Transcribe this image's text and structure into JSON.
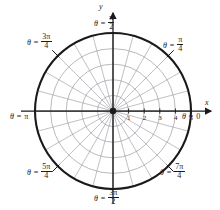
{
  "figure": {
    "kind": "polar-coordinate-grid",
    "background_color": "#ffffff",
    "ink_color": "#1a1a1a",
    "grid_color": "#8c8c96",
    "axis_color": "#4a4a4a",
    "center": {
      "x": 113,
      "y": 111
    },
    "outer_radius_px": 78
  },
  "axes": {
    "x_label": "x",
    "y_label": "y",
    "x_arrow": true,
    "y_arrow": true
  },
  "radial_ticks": {
    "values": [
      "1",
      "2",
      "3",
      "4",
      "5"
    ],
    "count": 5,
    "max": 5
  },
  "grid": {
    "circle_radii": [
      1,
      2,
      3,
      4,
      5
    ],
    "bold_circle_radius": 5,
    "spoke_count": 24,
    "spoke_step_label": "pi/12",
    "outer_tick_angles_deg": [
      45,
      135,
      225,
      315
    ]
  },
  "angle_labels": [
    {
      "id": "theta-0",
      "eq": "θ =",
      "value": "0",
      "kind": "plain",
      "angle_deg": 0,
      "x": 182,
      "y": 113
    },
    {
      "id": "theta-pi-4",
      "eq": "θ =",
      "num": "π",
      "den": "4",
      "kind": "frac",
      "angle_deg": 45,
      "x": 163,
      "y": 36
    },
    {
      "id": "theta-pi-2",
      "eq": "θ =",
      "num": "π",
      "den": "2",
      "kind": "frac",
      "angle_deg": 90,
      "x": 94,
      "y": 14
    },
    {
      "id": "theta-3pi-4",
      "eq": "θ =",
      "num": "3π",
      "den": "4",
      "kind": "frac",
      "angle_deg": 135,
      "x": 27,
      "y": 33
    },
    {
      "id": "theta-pi",
      "eq": "θ =",
      "value": "π",
      "kind": "plain",
      "angle_deg": 180,
      "x": 10,
      "y": 113
    },
    {
      "id": "theta-5pi-4",
      "eq": "θ =",
      "num": "5π",
      "den": "4",
      "kind": "frac",
      "angle_deg": 225,
      "x": 27,
      "y": 163
    },
    {
      "id": "theta-3pi-2",
      "eq": "θ =",
      "num": "3π",
      "den": "2",
      "kind": "frac",
      "angle_deg": 270,
      "x": 94,
      "y": 189
    },
    {
      "id": "theta-7pi-4",
      "eq": "θ =",
      "num": "7π",
      "den": "4",
      "kind": "frac",
      "angle_deg": 315,
      "x": 160,
      "y": 163
    }
  ]
}
